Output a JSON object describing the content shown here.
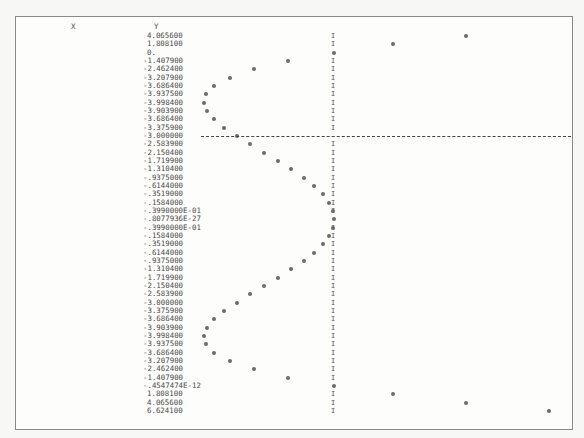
{
  "chart_data": {
    "type": "table",
    "title": "",
    "columns": [
      "X",
      "Y"
    ],
    "xlabel": "X",
    "ylabel": "Y",
    "rows": [
      [
        "-1.200000",
        "4.065600"
      ],
      [
        "-1.100000",
        "1.808100"
      ],
      [
        "-1.000000",
        "0."
      ],
      [
        "-.9000000",
        "-1.407900"
      ],
      [
        "-.8000000",
        "-2.462400"
      ],
      [
        "-.7000000",
        "-3.207900"
      ],
      [
        "-.6000000",
        "-3.686400"
      ],
      [
        "-.5000000",
        "-3.937500"
      ],
      [
        "-.4000000",
        "-3.998400"
      ],
      [
        "-.3000000",
        "-3.903900"
      ],
      [
        "-.2000000",
        "-3.686400"
      ],
      [
        "-.1000000",
        "-3.375900"
      ],
      [
        "-.7105427E-14",
        "-3.000000"
      ],
      [
        ".1000000E+00",
        "-2.583900"
      ],
      [
        ".2000000",
        "-2.150400"
      ],
      [
        ".3000000",
        "-1.719900"
      ],
      [
        ".4000000",
        "-1.310400"
      ],
      [
        ".5000000",
        "-.9375000"
      ],
      [
        ".6000000",
        "-.6144000"
      ],
      [
        ".7000000",
        "-.3519000"
      ],
      [
        ".8000000",
        "-.1584000"
      ],
      [
        ".9000000",
        "-.3990000E-01"
      ],
      [
        "1.0000000",
        "-.8077936E-27"
      ],
      [
        "1.100000",
        "-.3990000E-01"
      ],
      [
        "1.200000",
        "-.1584000"
      ],
      [
        "1.300000",
        "-.3519000"
      ],
      [
        "1.400000",
        "-.6144000"
      ],
      [
        "1.500000",
        "-.9375000"
      ],
      [
        "1.600000",
        "-1.310400"
      ],
      [
        "1.700000",
        "-1.719900"
      ],
      [
        "1.800000",
        "-2.150400"
      ],
      [
        "1.900000",
        "-2.583900"
      ],
      [
        "2.000000",
        "-3.000000"
      ],
      [
        "2.100000",
        "-3.375900"
      ],
      [
        "2.200000",
        "-3.686400"
      ],
      [
        "2.300000",
        "-3.903900"
      ],
      [
        "2.400000",
        "-3.998400"
      ],
      [
        "2.500000",
        "-3.937500"
      ],
      [
        "2.600000",
        "-3.686400"
      ],
      [
        "2.700000",
        "-3.207900"
      ],
      [
        "2.800000",
        "-2.462400"
      ],
      [
        "2.900000",
        "-1.407900"
      ],
      [
        "3.000000",
        "-.4547474E-12"
      ],
      [
        "3.100000",
        "1.808100"
      ],
      [
        "3.200000",
        "4.065600"
      ],
      [
        "3.300000",
        "6.624100"
      ]
    ],
    "x": [
      -1.2,
      -1.1,
      -1.0,
      -0.9,
      -0.8,
      -0.7,
      -0.6,
      -0.5,
      -0.4,
      -0.3,
      -0.2,
      -0.1,
      0.0,
      0.1,
      0.2,
      0.3,
      0.4,
      0.5,
      0.6,
      0.7,
      0.8,
      0.9,
      1.0,
      1.1,
      1.2,
      1.3,
      1.4,
      1.5,
      1.6,
      1.7,
      1.8,
      1.9,
      2.0,
      2.1,
      2.2,
      2.3,
      2.4,
      2.5,
      2.6,
      2.7,
      2.8,
      2.9,
      3.0,
      3.1,
      3.2,
      3.3
    ],
    "y": [
      4.0656,
      1.8081,
      0.0,
      -1.4079,
      -2.4624,
      -3.2079,
      -3.6864,
      -3.9375,
      -3.9984,
      -3.9039,
      -3.6864,
      -3.3759,
      -3.0,
      -2.5839,
      -2.1504,
      -1.7199,
      -1.3104,
      -0.9375,
      -0.6144,
      -0.3519,
      -0.1584,
      -0.0399,
      0.0,
      -0.0399,
      -0.1584,
      -0.3519,
      -0.6144,
      -0.9375,
      -1.3104,
      -1.7199,
      -2.1504,
      -2.5839,
      -3.0,
      -3.3759,
      -3.6864,
      -3.9039,
      -3.9984,
      -3.9375,
      -3.6864,
      -3.2079,
      -2.4624,
      -1.4079,
      0.0,
      1.8081,
      4.0656,
      6.6241
    ],
    "plot_style": "line-printer sideways plot: X down rows, Y horizontal; 'I' marks Y=0 axis, dashed line marks X=0",
    "axis_marker": "I",
    "zero_row_marker": "-",
    "xlim": [
      -1.2,
      3.3
    ],
    "ylim": [
      -4.0,
      6.7
    ]
  }
}
